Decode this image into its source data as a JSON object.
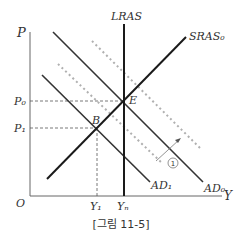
{
  "caption": "[그림 11-5]",
  "axes": {
    "y_label": "P",
    "x_label": "Y",
    "origin_label": "O",
    "y_ticks": [
      {
        "label": "P₀",
        "y": 101
      },
      {
        "label": "P₁",
        "y": 128
      }
    ],
    "x_ticks": [
      {
        "label": "Y₁",
        "x": 97
      },
      {
        "label": "Yₙ",
        "x": 124
      }
    ]
  },
  "curves": {
    "lras": {
      "label": "LRAS"
    },
    "sras0": {
      "label": "SRAS₀"
    },
    "ad0": {
      "label": "AD₀"
    },
    "ad1": {
      "label": "AD₁"
    },
    "shifted_dotted_upper": {
      "label": ""
    },
    "shifted_dotted_lower": {
      "label": ""
    }
  },
  "points": {
    "E": {
      "label": "E",
      "x": 124,
      "y": 101
    },
    "B": {
      "label": "B",
      "x": 97,
      "y": 128
    }
  },
  "annotation": {
    "shift_marker": "①"
  },
  "colors": {
    "axis": "#555555",
    "curve": "#2a2a2a",
    "sras": "#1a1a1a",
    "dotted": "#b0b0b0",
    "dashed_guide": "#555555"
  }
}
